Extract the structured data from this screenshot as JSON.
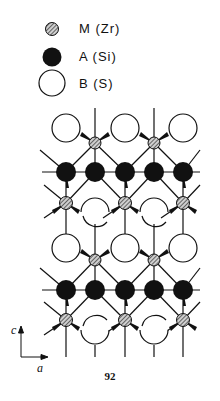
{
  "legend": [
    {
      "symbol": "hatched-small-circle",
      "label": "M (Zr)"
    },
    {
      "symbol": "filled-black-circle",
      "label": "A (Si)"
    },
    {
      "symbol": "open-large-circle",
      "label": "B (S)"
    }
  ],
  "axes": {
    "vertical": "c",
    "horizontal": "a"
  },
  "page_number": "92",
  "structure": {
    "columns_x": [
      66,
      95,
      125,
      154,
      183
    ],
    "layers": [
      {
        "type": "B",
        "y": 128,
        "x": [
          66,
          125,
          183
        ]
      },
      {
        "type": "M",
        "y": 143,
        "x": [
          95,
          154
        ]
      },
      {
        "type": "A",
        "y": 172,
        "x": [
          66,
          95,
          125,
          154,
          183
        ]
      },
      {
        "type": "M",
        "y": 203,
        "x": [
          66,
          125,
          183
        ]
      },
      {
        "type": "B-half-up",
        "y": 212,
        "x": [
          95,
          154
        ]
      },
      {
        "type": "B",
        "y": 248,
        "x": [
          66,
          125,
          183
        ]
      },
      {
        "type": "M",
        "y": 260,
        "x": [
          95,
          154
        ]
      },
      {
        "type": "A",
        "y": 290,
        "x": [
          66,
          95,
          125,
          154,
          183
        ]
      },
      {
        "type": "M",
        "y": 320,
        "x": [
          66,
          125,
          183
        ]
      },
      {
        "type": "B-half-down",
        "y": 334,
        "x": [
          95,
          154
        ]
      }
    ]
  },
  "colors": {
    "ink": "#111111",
    "background": "#ffffff",
    "hatch_fill": "#9a9a9a"
  }
}
